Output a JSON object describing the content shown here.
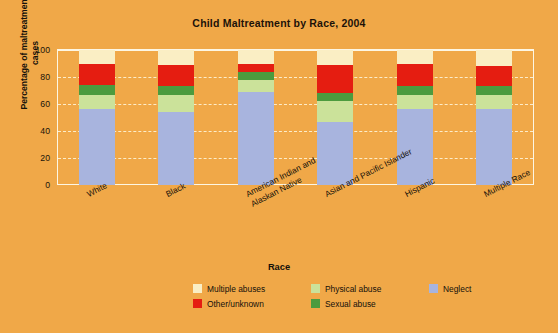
{
  "chart_data": {
    "type": "bar",
    "subtype": "stacked-percentage",
    "title": "Child Maltreatment by Race, 2004",
    "xlabel": "Race",
    "ylabel": "Percentage of maltreatment cases",
    "ylim": [
      0,
      100
    ],
    "yticks": [
      0,
      20,
      40,
      60,
      80,
      100
    ],
    "grid": true,
    "legend_position": "bottom",
    "background_color": "#f0a848",
    "categories": [
      "White",
      "Black",
      "American Indian and Alaskan Native",
      "Asian and Pacific Islander",
      "Hispanic",
      "Multiple Race"
    ],
    "category_lines": [
      [
        "White"
      ],
      [
        "Black"
      ],
      [
        "American Indian and",
        "Alaskan Native"
      ],
      [
        "Asian and Pacific Islander"
      ],
      [
        "Hispanic"
      ],
      [
        "Multiple Race"
      ]
    ],
    "series": [
      {
        "name": "Neglect",
        "color": "#a8b4de",
        "values": [
          56,
          54,
          69,
          47,
          56,
          56
        ]
      },
      {
        "name": "Physical abuse",
        "color": "#cbe29a",
        "values": [
          11,
          13,
          9,
          15,
          11,
          11
        ]
      },
      {
        "name": "Sexual abuse",
        "color": "#4c9b3e",
        "values": [
          7,
          6,
          6,
          6,
          6,
          6
        ]
      },
      {
        "name": "Other/unknown",
        "color": "#e51d11",
        "values": [
          16,
          16,
          6,
          21,
          17,
          15
        ]
      },
      {
        "name": "Multiple abuses",
        "color": "#faeec4",
        "values": [
          10,
          11,
          10,
          11,
          10,
          12
        ]
      }
    ],
    "legend_entries": [
      {
        "label": "Multiple abuses",
        "color": "#faeec4"
      },
      {
        "label": "Physical abuse",
        "color": "#cbe29a"
      },
      {
        "label": "Neglect",
        "color": "#a8b4de"
      },
      {
        "label": "Other/unknown",
        "color": "#e51d11"
      },
      {
        "label": "Sexual abuse",
        "color": "#4c9b3e"
      }
    ]
  }
}
